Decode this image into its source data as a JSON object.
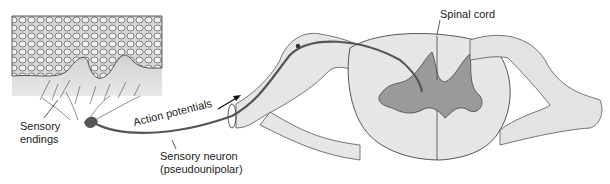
{
  "diagram": {
    "type": "anatomical",
    "labels": {
      "spinal_cord": "Spinal cord",
      "sensory_endings_1": "Sensory",
      "sensory_endings_2": "endings",
      "action_potentials": "Action potentials",
      "sensory_neuron_1": "Sensory neuron",
      "sensory_neuron_2": "(pseudounipolar)"
    },
    "colors": {
      "tissue": "#e6e6e6",
      "gray_matter": "#9a9a9a",
      "outline": "#444444",
      "nerve": "#555555"
    }
  }
}
